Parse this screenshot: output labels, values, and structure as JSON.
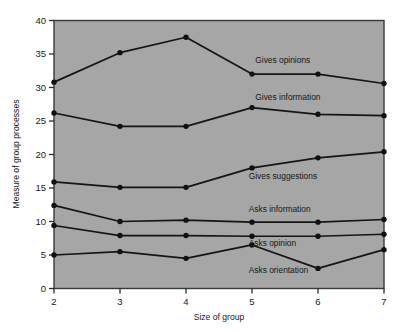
{
  "chart_data": {
    "type": "line",
    "title": "",
    "xlabel": "Size of group",
    "ylabel": "Measure of group processes",
    "x": [
      2,
      3,
      4,
      5,
      6,
      7
    ],
    "xlim": [
      2,
      7
    ],
    "ylim": [
      0,
      40
    ],
    "xticks": [
      "2",
      "3",
      "4",
      "5",
      "6",
      "7"
    ],
    "yticks": [
      "0",
      "5",
      "10",
      "15",
      "20",
      "25",
      "30",
      "35",
      "40"
    ],
    "grid": false,
    "legend_position": "inline-right",
    "plot_background_color": "#a6a6a6",
    "line_color": "#151515",
    "marker_color": "#111111",
    "series": [
      {
        "name": "Gives opinions",
        "values": [
          30.8,
          35.2,
          37.5,
          32.0,
          32.0,
          30.6
        ],
        "label_x": 5.05,
        "label_y": 33.6
      },
      {
        "name": "Gives information",
        "values": [
          26.2,
          24.2,
          24.2,
          27.0,
          26.0,
          25.8
        ],
        "label_x": 5.05,
        "label_y": 28.1
      },
      {
        "name": "Gives suggestions",
        "values": [
          15.9,
          15.1,
          15.1,
          18.0,
          19.5,
          20.4
        ],
        "label_x": 4.95,
        "label_y": 16.3
      },
      {
        "name": "Asks information",
        "values": [
          12.4,
          10.0,
          10.2,
          9.9,
          9.9,
          10.3
        ],
        "label_x": 4.95,
        "label_y": 11.4
      },
      {
        "name": "Asks opinion",
        "values": [
          9.4,
          7.9,
          7.9,
          7.8,
          7.8,
          8.1
        ],
        "label_x": 4.95,
        "label_y": 6.4
      },
      {
        "name": "Asks orientation",
        "values": [
          5.0,
          5.5,
          4.5,
          6.5,
          3.0,
          5.8
        ],
        "label_x": 4.95,
        "label_y": 2.3
      }
    ]
  }
}
